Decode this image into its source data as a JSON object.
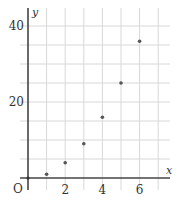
{
  "chart_data": {
    "type": "scatter",
    "title": "",
    "xlabel": "x",
    "ylabel": "y",
    "origin_label": "O",
    "x": [
      1,
      2,
      3,
      4,
      5,
      6
    ],
    "series": [
      {
        "name": "y",
        "values": [
          1,
          4,
          9,
          16,
          25,
          36
        ]
      }
    ],
    "xlim": [
      0,
      7
    ],
    "ylim": [
      0,
      40
    ],
    "x_ticks": [
      2,
      4,
      6
    ],
    "x_tick_labels": [
      "2",
      "4",
      "6"
    ],
    "y_ticks": [
      20,
      40
    ],
    "y_tick_labels": [
      "20",
      "40"
    ],
    "x_grid_step": 1,
    "y_grid_step": 5,
    "grid": true,
    "legend": "none",
    "point_color": "#555555",
    "axis_color": "#444444",
    "grid_color": "#d8d8d8"
  }
}
